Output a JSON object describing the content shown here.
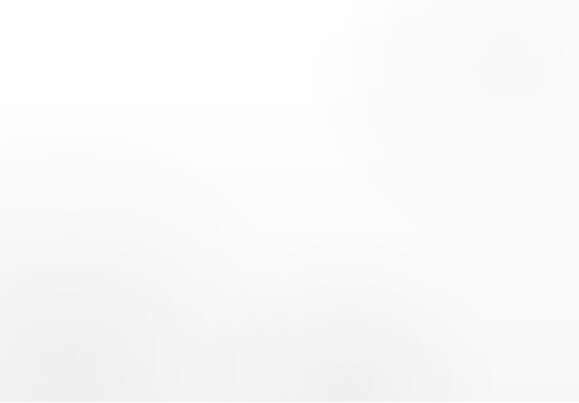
{
  "figure": {
    "frame_color": "#b9b9b9",
    "grid_color": "#d7d7d7",
    "axis_color": "#4a4a4a",
    "background": "#fbfbfb",
    "tick_label_color": "#2f2f2f"
  },
  "axis": {
    "x_ticks": [
      "2017",
      "2018",
      "2019",
      "2020",
      "2021"
    ]
  },
  "chart_data": {
    "type": "bar",
    "title": "",
    "subtitle": "",
    "xlabel": "",
    "ylabel": "",
    "stacked": true,
    "grid": true,
    "legend": "none",
    "categories": [
      "2017",
      "2018",
      "2019",
      "2020",
      "2021"
    ],
    "ylim": [
      0,
      215
    ],
    "series": [
      {
        "name": "Segment 1",
        "color": "#434343",
        "values": [
          27,
          25,
          28,
          32,
          31
        ]
      },
      {
        "name": "Segment 2",
        "color": "#262626",
        "values": [
          25,
          28,
          29,
          31,
          33
        ]
      },
      {
        "name": "Segment 3",
        "color": "#3a3a3a",
        "values": [
          26,
          28,
          29,
          45,
          42
        ]
      },
      {
        "name": "Segment 4",
        "color": "#111111",
        "values": [
          28,
          28,
          42,
          42,
          50
        ]
      },
      {
        "name": "Segment 5",
        "color": "#3d3d3d",
        "values": [
          24,
          31,
          30,
          31,
          43
        ]
      },
      {
        "name": "Segment 6",
        "color": "#3a3a3a",
        "values": [
          25,
          30,
          29,
          34,
          33
        ]
      }
    ],
    "totals": [
      155,
      170,
      187,
      215,
      232
    ]
  },
  "bars": [
    {
      "category": "2017",
      "left": 48,
      "width": 89,
      "segments": [
        {
          "name": "seg-top",
          "color": "#3a3a3a",
          "height": 27
        },
        {
          "name": "seg-2",
          "color": "#3d3d3d",
          "height": 24
        },
        {
          "name": "seg-3",
          "color": "#111111",
          "height": 28
        },
        {
          "name": "seg-4",
          "color": "#3a3a3a",
          "height": 26
        },
        {
          "name": "seg-5",
          "color": "#262626",
          "height": 25
        },
        {
          "name": "seg-bottom",
          "color": "#434343",
          "height": 27
        }
      ]
    },
    {
      "category": "2018",
      "left": 147,
      "width": 89,
      "segments": [
        {
          "name": "seg-top",
          "color": "#3a3a3a",
          "height": 30
        },
        {
          "name": "seg-2",
          "color": "#3d3d3d",
          "height": 31
        },
        {
          "name": "seg-3",
          "color": "#111111",
          "height": 28
        },
        {
          "name": "seg-4",
          "color": "#3a3a3a",
          "height": 28
        },
        {
          "name": "seg-5",
          "color": "#262626",
          "height": 28
        },
        {
          "name": "seg-bottom",
          "color": "#434343",
          "height": 25
        }
      ]
    },
    {
      "category": "2019",
      "left": 245,
      "width": 89,
      "segments": [
        {
          "name": "seg-top",
          "color": "#3a3a3a",
          "height": 29
        },
        {
          "name": "seg-2",
          "color": "#3d3d3d",
          "height": 30
        },
        {
          "name": "seg-3",
          "color": "#111111",
          "height": 42
        },
        {
          "name": "seg-4",
          "color": "#3a3a3a",
          "height": 29
        },
        {
          "name": "seg-5",
          "color": "#262626",
          "height": 29
        },
        {
          "name": "seg-bottom",
          "color": "#434343",
          "height": 28
        }
      ]
    },
    {
      "category": "2020",
      "left": 344,
      "width": 89,
      "segments": [
        {
          "name": "seg-top",
          "color": "#3a3a3a",
          "height": 34
        },
        {
          "name": "seg-2",
          "color": "#3d3d3d",
          "height": 31
        },
        {
          "name": "seg-3",
          "color": "#111111",
          "height": 42
        },
        {
          "name": "seg-4",
          "color": "#3a3a3a",
          "height": 45
        },
        {
          "name": "seg-5",
          "color": "#262626",
          "height": 31
        },
        {
          "name": "seg-bottom",
          "color": "#434343",
          "height": 32
        }
      ]
    },
    {
      "category": "2021",
      "left": 443,
      "width": 89,
      "segments": [
        {
          "name": "seg-top",
          "color": "#3a3a3a",
          "height": 33
        },
        {
          "name": "seg-2",
          "color": "#3d3d3d",
          "height": 43
        },
        {
          "name": "seg-3",
          "color": "#111111",
          "height": 50
        },
        {
          "name": "seg-4",
          "color": "#3a3a3a",
          "height": 42
        },
        {
          "name": "seg-5",
          "color": "#262626",
          "height": 33
        },
        {
          "name": "seg-bottom",
          "color": "#434343",
          "height": 31
        }
      ]
    }
  ],
  "gridlines": {
    "vertical_x": [
      48,
      290,
      532
    ],
    "horizontal_y": [
      69,
      355
    ]
  }
}
